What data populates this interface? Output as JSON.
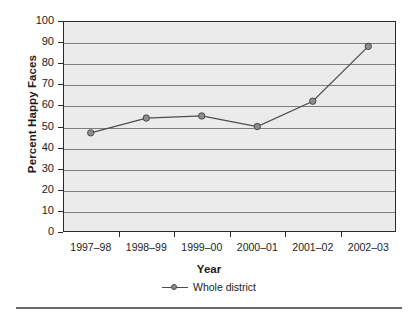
{
  "chart_data": {
    "type": "line",
    "title": "",
    "xlabel": "Year",
    "ylabel": "Percent Happy Faces",
    "categories": [
      "1997–98",
      "1998–99",
      "1999–00",
      "2000–01",
      "2001–02",
      "2002–03"
    ],
    "series": [
      {
        "name": "Whole district",
        "values": [
          47,
          54,
          55,
          50,
          62,
          88
        ],
        "line_color": "#4d4d4d",
        "marker_color": "#8d8d8d",
        "marker_edge_color": "#4a4a4a"
      }
    ],
    "ylim": [
      0,
      100
    ],
    "ytick_values": [
      0,
      10,
      20,
      30,
      40,
      50,
      60,
      70,
      80,
      90,
      100
    ],
    "ytick_labels": [
      "0",
      "10",
      "20",
      "30",
      "40",
      "50",
      "60",
      "70",
      "80",
      "90",
      "100"
    ],
    "grid": "horizontal",
    "legend_position": "bottom-center",
    "plot_background": "#ebebeb",
    "frame_color": "#2b2b2b",
    "gridline_color": "#7d7d7d"
  },
  "legend": {
    "entries": [
      {
        "label": "Whole district"
      }
    ]
  },
  "axes": {
    "x_title": "Year",
    "y_title": "Percent Happy Faces"
  }
}
